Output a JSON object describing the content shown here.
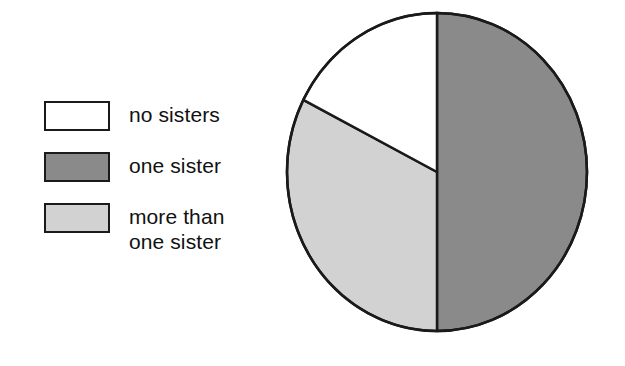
{
  "legend": {
    "items": [
      {
        "label": "no sisters",
        "color": "#ffffff",
        "swatch_name": "legend-swatch-no-sisters"
      },
      {
        "label": "one sister",
        "color": "#8a8a8a",
        "swatch_name": "legend-swatch-one-sister"
      },
      {
        "label": "more than\none sister",
        "color": "#d2d2d2",
        "swatch_name": "legend-swatch-more-than-one-sister"
      }
    ]
  },
  "chart_data": {
    "type": "pie",
    "title": "",
    "subtitle": "",
    "xlabel": "",
    "ylabel": "",
    "grid": false,
    "legend_position": "left",
    "categories": [
      "one sister",
      "more than one sister",
      "no sisters"
    ],
    "values": [
      50,
      32.5,
      17.5
    ],
    "slices": [
      {
        "label": "one sister",
        "value": 50,
        "percent": "50%",
        "color": "#8a8a8a",
        "start_angle_deg": 0,
        "end_angle_deg": 180,
        "position": "right half"
      },
      {
        "label": "more than one sister",
        "value": 32.5,
        "percent": "32.5%",
        "color": "#d2d2d2",
        "start_angle_deg": 180,
        "end_angle_deg": 297,
        "position": "lower left"
      },
      {
        "label": "no sisters",
        "value": 17.5,
        "percent": "17.5%",
        "color": "#ffffff",
        "start_angle_deg": 297,
        "end_angle_deg": 360,
        "position": "upper left"
      }
    ],
    "outline_color": "#1a1a1a",
    "center": {
      "x": 152,
      "y": 162
    },
    "radius": {
      "rx": 150,
      "ry": 159
    }
  }
}
